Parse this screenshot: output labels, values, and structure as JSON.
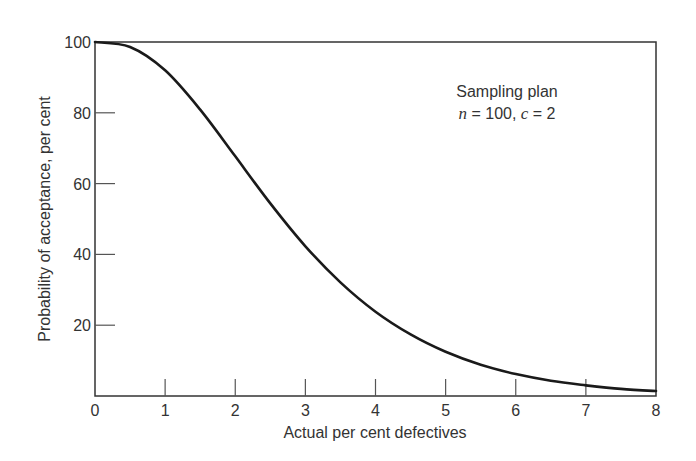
{
  "chart_data": {
    "type": "line",
    "title": "",
    "xlabel": "Actual per cent defectives",
    "ylabel": "Probability of acceptance, per cent",
    "xlim": [
      0,
      8
    ],
    "ylim": [
      0,
      100
    ],
    "x_ticks": [
      0,
      1,
      2,
      3,
      4,
      5,
      6,
      7,
      8
    ],
    "x_tick_labels": [
      "0",
      "1",
      "2",
      "3",
      "4",
      "5",
      "6",
      "7",
      "8"
    ],
    "y_ticks": [
      20,
      40,
      60,
      80,
      100
    ],
    "y_tick_labels": [
      "20",
      "40",
      "60",
      "80",
      "100"
    ],
    "grid": false,
    "legend": null,
    "annotation": {
      "line1": "Sampling plan",
      "n_label": "n",
      "n_value": "= 100,",
      "c_label": "c",
      "c_value": "= 2"
    },
    "series": [
      {
        "name": "OC curve (n = 100, c = 2)",
        "x": [
          0,
          0.5,
          1,
          1.5,
          2,
          2.5,
          3,
          3.5,
          4,
          4.5,
          5,
          5.5,
          6,
          6.5,
          7,
          7.5,
          8
        ],
        "values": [
          100,
          98.6,
          92.0,
          80.9,
          67.7,
          54.4,
          42.3,
          32.1,
          23.8,
          17.4,
          12.5,
          8.8,
          6.2,
          4.3,
          3.0,
          2.0,
          1.4
        ]
      }
    ]
  }
}
